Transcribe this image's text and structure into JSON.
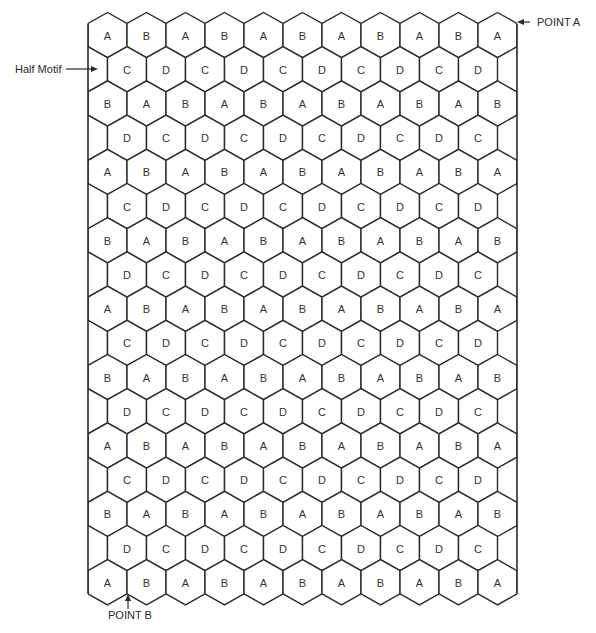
{
  "diagram": {
    "title": "",
    "grid": {
      "columns_full_row": 11,
      "columns_offset_row": 10,
      "hex_orientation": "pointy-top",
      "rows": [
        "ABABABABABA",
        "CDCDCDCDCD",
        "BABABABABAB",
        "DCDCDCDCDC",
        "ABABABABABA",
        "CDCDCDCDCD",
        "BABABABABAB",
        "DCDCDCDCDC",
        "ABABABABABA",
        "CDCDCDCDCD",
        "BABABABABAB",
        "DCDCDCDCDC",
        "ABABABABABA",
        "CDCDCDCDCD",
        "BABABABABAB",
        "DCDCDCDCDC",
        "ABABABABABA"
      ]
    },
    "callouts": {
      "half_motif": "Half Motif",
      "point_a": "POINT A",
      "point_b": "POINT B"
    },
    "colors": {
      "line": "#2a2a2a",
      "label": "#333333",
      "background": "#ffffff"
    }
  }
}
